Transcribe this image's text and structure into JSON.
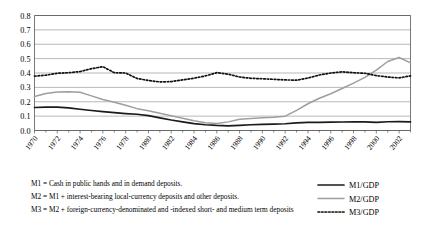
{
  "chart_data": {
    "type": "line",
    "title": "",
    "xlabel": "",
    "ylabel": "",
    "xlim": [
      1970,
      2003
    ],
    "ylim": [
      0.0,
      0.8
    ],
    "grid": true,
    "legend_position": "bottom-right",
    "ytick_labels": [
      "0.0",
      "0.1",
      "0.2",
      "0.3",
      "0.4",
      "0.5",
      "0.6",
      "0.7",
      "0.8"
    ],
    "ytick_values": [
      0.0,
      0.1,
      0.2,
      0.3,
      0.4,
      0.5,
      0.6,
      0.7,
      0.8
    ],
    "xtick_labels": [
      "1970",
      "1972",
      "1974",
      "1976",
      "1978",
      "1980",
      "1982",
      "1984",
      "1986",
      "1988",
      "1990",
      "1992",
      "1994",
      "1996",
      "1998",
      "2000",
      "2002"
    ],
    "xtick_values": [
      1970,
      1972,
      1974,
      1976,
      1978,
      1980,
      1982,
      1984,
      1986,
      1988,
      1990,
      1992,
      1994,
      1996,
      1998,
      2000,
      2002
    ],
    "x": [
      1970,
      1971,
      1972,
      1973,
      1974,
      1975,
      1976,
      1977,
      1978,
      1979,
      1980,
      1981,
      1982,
      1983,
      1984,
      1985,
      1986,
      1987,
      1988,
      1989,
      1990,
      1991,
      1992,
      1993,
      1994,
      1995,
      1996,
      1997,
      1998,
      1999,
      2000,
      2001,
      2002,
      2003
    ],
    "series": [
      {
        "name": "M1/GDP",
        "color": "#1a1a1a",
        "style": "solid",
        "values": [
          0.16,
          0.162,
          0.163,
          0.158,
          0.148,
          0.139,
          0.131,
          0.124,
          0.118,
          0.113,
          0.103,
          0.088,
          0.073,
          0.06,
          0.048,
          0.04,
          0.035,
          0.032,
          0.036,
          0.04,
          0.043,
          0.045,
          0.047,
          0.053,
          0.056,
          0.057,
          0.058,
          0.059,
          0.06,
          0.06,
          0.056,
          0.061,
          0.062,
          0.06
        ]
      },
      {
        "name": "M2/GDP",
        "color": "#9e9e9e",
        "style": "solid-gray",
        "values": [
          0.237,
          0.258,
          0.268,
          0.27,
          0.266,
          0.241,
          0.216,
          0.196,
          0.176,
          0.152,
          0.138,
          0.12,
          0.103,
          0.085,
          0.068,
          0.054,
          0.048,
          0.06,
          0.078,
          0.084,
          0.088,
          0.093,
          0.1,
          0.14,
          0.186,
          0.224,
          0.256,
          0.292,
          0.33,
          0.37,
          0.42,
          0.48,
          0.508,
          0.47
        ]
      },
      {
        "name": "M3/GDP",
        "color": "#111111",
        "style": "dotted",
        "values": [
          0.378,
          0.385,
          0.398,
          0.402,
          0.41,
          0.43,
          0.444,
          0.402,
          0.4,
          0.362,
          0.348,
          0.338,
          0.34,
          0.352,
          0.364,
          0.38,
          0.402,
          0.392,
          0.372,
          0.363,
          0.36,
          0.356,
          0.352,
          0.35,
          0.365,
          0.386,
          0.4,
          0.408,
          0.402,
          0.398,
          0.382,
          0.372,
          0.366,
          0.38
        ]
      }
    ]
  },
  "footnotes": {
    "line1": "M1 = Cash in public hands and in demand deposits.",
    "line2": "M2 = M1 + interest-bearing local-currency deposits and other deposits.",
    "line3": "M3 = M2 + foreign-currency-denominated and -indexed short- and medium term deposits"
  },
  "legend": {
    "items": [
      {
        "label": "M1/GDP",
        "color": "#1a1a1a",
        "style": "solid"
      },
      {
        "label": "M2/GDP",
        "color": "#9e9e9e",
        "style": "solid-gray"
      },
      {
        "label": "M3/GDP",
        "color": "#111111",
        "style": "dotted"
      }
    ]
  }
}
